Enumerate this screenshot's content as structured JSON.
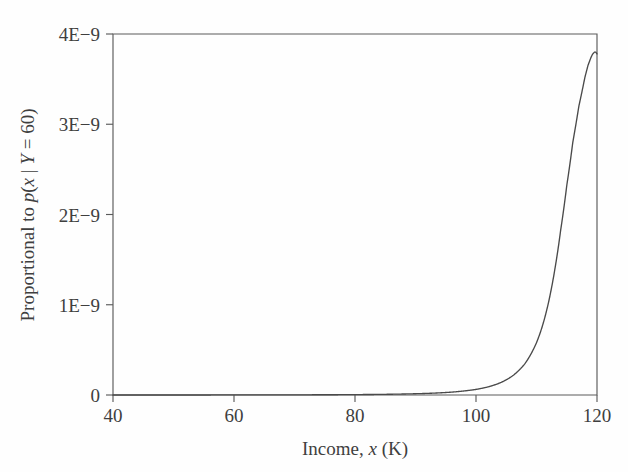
{
  "figure": {
    "background_color": "#fefefe",
    "frame_color": "#5b5b5b",
    "curve_color": "#4a4a4a",
    "text_color": "#3f3f3f"
  },
  "axis_titles": {
    "x_part_1": "Income, ",
    "x_part_2": "x",
    "x_part_3": " (K)",
    "y_part_1": "Proportional to ",
    "y_part_2": "p",
    "y_part_3": "(",
    "y_part_4": "x",
    "y_part_5": " | ",
    "y_part_6": "Y",
    "y_part_7": " = 60)"
  },
  "x_ticks": [
    {
      "value": 40,
      "label": "40"
    },
    {
      "value": 60,
      "label": "60"
    },
    {
      "value": 80,
      "label": "80"
    },
    {
      "value": 100,
      "label": "100"
    },
    {
      "value": 120,
      "label": "120"
    }
  ],
  "y_ticks": [
    {
      "value": 0,
      "label": "0"
    },
    {
      "value": 1e-09,
      "label": "1E−9"
    },
    {
      "value": 2e-09,
      "label": "2E−9"
    },
    {
      "value": 3e-09,
      "label": "3E−9"
    },
    {
      "value": 4e-09,
      "label": "4E−9"
    }
  ],
  "chart_data": {
    "type": "line",
    "title": "",
    "xlabel": "Income, x (K)",
    "ylabel": "Proportional to p(x | Y = 60)",
    "xlim": [
      40,
      120
    ],
    "ylim": [
      0,
      4e-09
    ],
    "grid": false,
    "legend": null,
    "series": [
      {
        "name": "Proportional to p(x | Y = 60)",
        "x": [
          40,
          44,
          48,
          52,
          56,
          60,
          64,
          68,
          72,
          76,
          80,
          84,
          88,
          92,
          96,
          100,
          102,
          104,
          106,
          108,
          110,
          111,
          112,
          113,
          114,
          115,
          116,
          117,
          118,
          118.5,
          119,
          119.3,
          119.6,
          119.8,
          120
        ],
        "y": [
          2e-13,
          2.6e-13,
          3.4e-13,
          4.5e-13,
          6e-13,
          8e-13,
          1.1e-12,
          1.5e-12,
          2.1e-12,
          3e-12,
          4.4e-12,
          6.7e-12,
          1.1e-11,
          1.8e-11,
          3.2e-11,
          6.2e-11,
          9e-11,
          1.35e-10,
          2.1e-10,
          3.4e-10,
          5.8e-10,
          7.7e-10,
          1.03e-09,
          1.38e-09,
          1.83e-09,
          2.32e-09,
          2.8e-09,
          3.2e-09,
          3.52e-09,
          3.65e-09,
          3.74e-09,
          3.78e-09,
          3.8e-09,
          3.8e-09,
          3.78e-09
        ]
      }
    ]
  }
}
